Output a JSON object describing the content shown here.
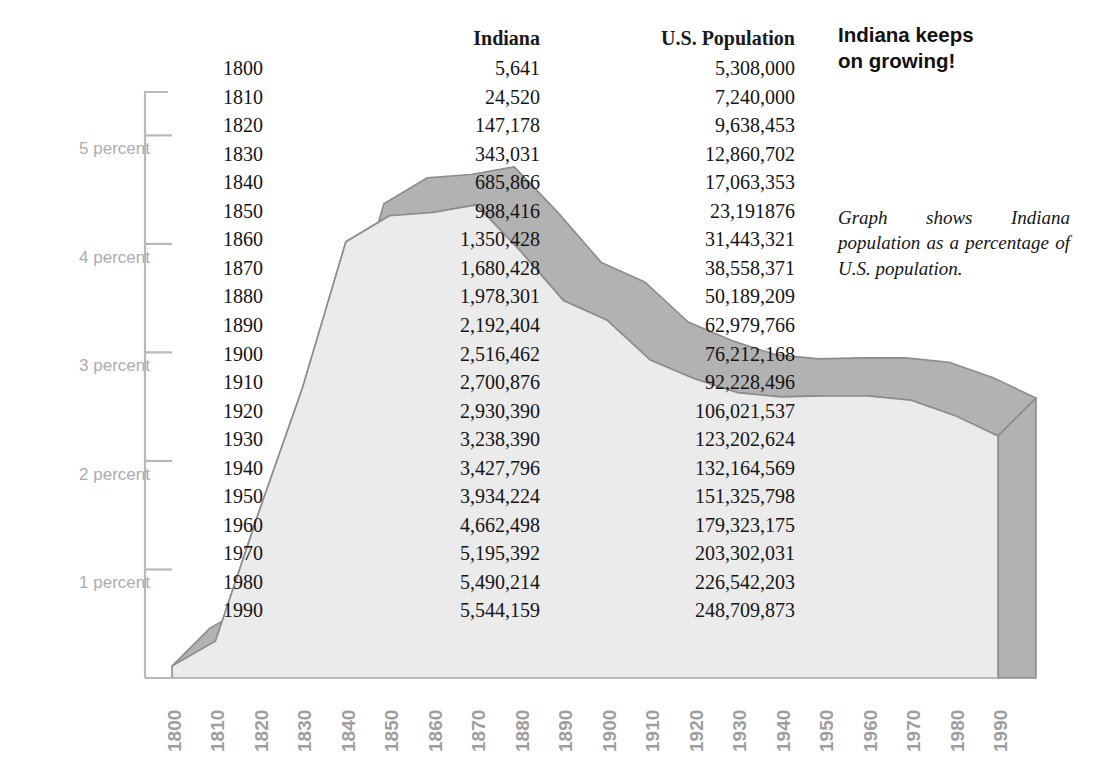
{
  "headline": "Indiana keeps\non growing!",
  "note": "Graph shows Indiana population as a percentage of U.S. population.",
  "colors": {
    "front_face": "#ebebeb",
    "top_face": "#b2b2b2",
    "side_face": "#b2b2b2",
    "outline": "#8c8c8c",
    "axis": "#b9b9b9",
    "ylabel": "#adadad",
    "xlabel": "#9e9e9e",
    "text": "#141414"
  },
  "table": {
    "headers": [
      "",
      "Indiana",
      "U.S. Population"
    ],
    "rows": [
      {
        "year": "1800",
        "indiana": "5,641",
        "us": "5,308,000"
      },
      {
        "year": "1810",
        "indiana": "24,520",
        "us": "7,240,000"
      },
      {
        "year": "1820",
        "indiana": "147,178",
        "us": "9,638,453"
      },
      {
        "year": "1830",
        "indiana": "343,031",
        "us": "12,860,702"
      },
      {
        "year": "1840",
        "indiana": "685,866",
        "us": "17,063,353"
      },
      {
        "year": "1850",
        "indiana": "988,416",
        "us": "23,191876"
      },
      {
        "year": "1860",
        "indiana": "1,350,428",
        "us": "31,443,321"
      },
      {
        "year": "1870",
        "indiana": "1,680,428",
        "us": "38,558,371"
      },
      {
        "year": "1880",
        "indiana": "1,978,301",
        "us": "50,189,209"
      },
      {
        "year": "1890",
        "indiana": "2,192,404",
        "us": "62,979,766"
      },
      {
        "year": "1900",
        "indiana": "2,516,462",
        "us": "76,212,168"
      },
      {
        "year": "1910",
        "indiana": "2,700,876",
        "us": "92,228,496"
      },
      {
        "year": "1920",
        "indiana": "2,930,390",
        "us": "106,021,537"
      },
      {
        "year": "1930",
        "indiana": "3,238,390",
        "us": "123,202,624"
      },
      {
        "year": "1940",
        "indiana": "3,427,796",
        "us": "132,164,569"
      },
      {
        "year": "1950",
        "indiana": "3,934,224",
        "us": "151,325,798"
      },
      {
        "year": "1960",
        "indiana": "4,662,498",
        "us": "179,323,175"
      },
      {
        "year": "1970",
        "indiana": "5,195,392",
        "us": "203,302,031"
      },
      {
        "year": "1980",
        "indiana": "5,490,214",
        "us": "226,542,203"
      },
      {
        "year": "1990",
        "indiana": "5,544,159",
        "us": "248,709,873"
      }
    ]
  },
  "chart_data": {
    "type": "area",
    "subtitle": "Graph shows Indiana population as a percentage of U.S. population.",
    "xlabel": "",
    "ylabel": "percent",
    "grid": false,
    "legend": null,
    "style": "3d-extruded-area",
    "ylim": [
      0,
      5.4
    ],
    "yticks": [
      1,
      2,
      3,
      4,
      5
    ],
    "ytick_labels": [
      "1 percent",
      "2 percent",
      "3 percent",
      "4 percent",
      "5 percent"
    ],
    "x": [
      "1800",
      "1810",
      "1820",
      "1830",
      "1840",
      "1850",
      "1860",
      "1870",
      "1880",
      "1890",
      "1900",
      "1910",
      "1920",
      "1930",
      "1940",
      "1950",
      "1960",
      "1970",
      "1980",
      "1990"
    ],
    "xtick_labels": [
      "1800",
      "1810",
      "1820",
      "1830",
      "1840",
      "1850",
      "1860",
      "1870",
      "1880",
      "1890",
      "1900",
      "1910",
      "1920",
      "1930",
      "1940",
      "1950",
      "1960",
      "1970",
      "1980",
      "1990"
    ],
    "series": [
      {
        "name": "Indiana population as percent of U.S. population",
        "values": [
          0.11,
          0.34,
          1.53,
          2.67,
          4.02,
          4.26,
          4.29,
          4.36,
          3.94,
          3.48,
          3.3,
          2.93,
          2.76,
          2.63,
          2.59,
          2.6,
          2.6,
          2.56,
          2.42,
          2.23
        ]
      }
    ]
  }
}
